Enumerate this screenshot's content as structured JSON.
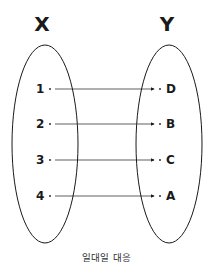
{
  "diagram": {
    "sets": [
      {
        "name": "X",
        "elements": [
          "1",
          "2",
          "3",
          "4"
        ]
      },
      {
        "name": "Y",
        "elements": [
          "D",
          "B",
          "C",
          "A"
        ]
      }
    ],
    "mappings": [
      {
        "from": "1",
        "to": "D"
      },
      {
        "from": "2",
        "to": "B"
      },
      {
        "from": "3",
        "to": "C"
      },
      {
        "from": "4",
        "to": "A"
      }
    ],
    "caption": "일대일 대응"
  }
}
